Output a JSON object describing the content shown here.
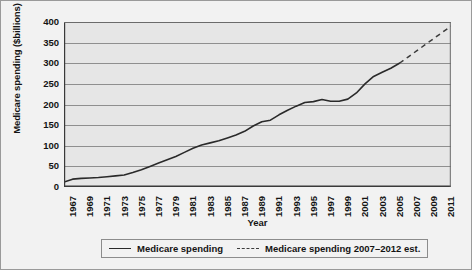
{
  "chart_data": {
    "type": "line",
    "title": "",
    "xlabel": "Year",
    "ylabel": "Medicare spending ($billions)",
    "xlim": [
      1967,
      2012
    ],
    "ylim": [
      0,
      400
    ],
    "grid": true,
    "legend_position": "bottom",
    "ytick_labels": [
      "0",
      "50",
      "100",
      "150",
      "200",
      "250",
      "300",
      "350",
      "400"
    ],
    "ytick_values": [
      0,
      50,
      100,
      150,
      200,
      250,
      300,
      350,
      400
    ],
    "xtick_labels": [
      "1967",
      "1969",
      "1971",
      "1973",
      "1975",
      "1977",
      "1979",
      "1981",
      "1983",
      "1985",
      "1987",
      "1989",
      "1991",
      "1993",
      "1995",
      "1997",
      "1999",
      "2001",
      "2003",
      "2005",
      "2007",
      "2009",
      "2011"
    ],
    "xtick_values": [
      1967,
      1969,
      1971,
      1973,
      1975,
      1977,
      1979,
      1981,
      1983,
      1985,
      1987,
      1989,
      1991,
      1993,
      1995,
      1997,
      1999,
      2001,
      2003,
      2005,
      2007,
      2009,
      2011
    ],
    "minor_xticks_every": 1,
    "series": [
      {
        "name": "Medicare spending",
        "style": "solid",
        "color": "#2a2a2a",
        "x": [
          1967,
          1968,
          1969,
          1970,
          1971,
          1972,
          1973,
          1974,
          1975,
          1976,
          1977,
          1978,
          1979,
          1980,
          1981,
          1982,
          1983,
          1984,
          1985,
          1986,
          1987,
          1988,
          1989,
          1990,
          1991,
          1992,
          1993,
          1994,
          1995,
          1996,
          1997,
          1998,
          1999,
          2000,
          2001,
          2002,
          2003,
          2004,
          2005,
          2006
        ],
        "values": [
          12,
          19,
          21,
          22,
          23,
          25,
          27,
          30,
          38,
          45,
          53,
          61,
          70,
          80,
          92,
          104,
          114,
          122,
          131,
          140,
          146,
          152,
          163,
          175,
          180,
          195,
          210,
          225,
          240,
          255,
          273,
          281,
          280,
          283,
          295,
          311,
          328,
          345,
          362,
          380
        ],
        "values_note": "Curve read off gridlines; 1997 ~200, 1999 plateau ~200, 2006 ~300",
        "values_corrected": [
          12,
          19,
          21,
          22,
          23,
          25,
          27,
          29,
          35,
          42,
          50,
          58,
          66,
          74,
          84,
          94,
          102,
          107,
          112,
          119,
          126,
          135,
          148,
          158,
          162,
          175,
          186,
          196,
          205,
          207,
          212,
          208,
          208,
          213,
          228,
          250,
          268,
          278,
          288,
          300
        ]
      },
      {
        "name": "Medicare spending 2007–2012 est.",
        "style": "dashed",
        "color": "#3c3c3c",
        "x": [
          2006,
          2007,
          2008,
          2009,
          2010,
          2011,
          2012
        ],
        "values": [
          300,
          315,
          330,
          345,
          360,
          375,
          390
        ]
      }
    ]
  },
  "legend": {
    "items": [
      {
        "label": "Medicare spending",
        "style": "solid"
      },
      {
        "label": "Medicare spending 2007–2012 est.",
        "style": "dashed"
      }
    ]
  },
  "axes": {
    "y_title": "Medicare spending ($billions)",
    "x_title": "Year"
  },
  "colors": {
    "figure_background": "#f2f2f2",
    "plot_background": "#e6e6e6",
    "gridline": "#8f8f8f",
    "axis": "#3a3a3a",
    "text": "#141414",
    "series_solid": "#2a2a2a",
    "series_dashed": "#3c3c3c"
  }
}
